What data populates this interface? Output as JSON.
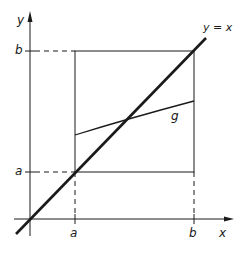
{
  "diagram": {
    "title": "",
    "axes": {
      "x_label": "x",
      "y_label": "y",
      "x_ticks": [
        {
          "label": "a"
        },
        {
          "label": "b"
        }
      ],
      "y_ticks": [
        {
          "label": "a"
        },
        {
          "label": "b"
        }
      ]
    },
    "lines": {
      "diagonal_label": "y = x",
      "curve_label": "g"
    },
    "colors": {
      "ink": "#1a1a1a",
      "background": "#ffffff"
    }
  }
}
